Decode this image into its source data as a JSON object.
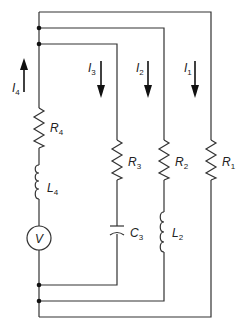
{
  "diagram": {
    "type": "circuit",
    "components": {
      "R1": {
        "label": "R",
        "sub": "1"
      },
      "R2": {
        "label": "R",
        "sub": "2"
      },
      "R3": {
        "label": "R",
        "sub": "3"
      },
      "R4": {
        "label": "R",
        "sub": "4"
      },
      "L2": {
        "label": "L",
        "sub": "2"
      },
      "L4": {
        "label": "L",
        "sub": "4"
      },
      "C3": {
        "label": "C",
        "sub": "3"
      },
      "V": {
        "label": "V"
      }
    },
    "currents": {
      "I1": {
        "label": "I",
        "sub": "1",
        "direction": "down"
      },
      "I2": {
        "label": "I",
        "sub": "2",
        "direction": "down"
      },
      "I3": {
        "label": "I",
        "sub": "3",
        "direction": "down"
      },
      "I4": {
        "label": "I",
        "sub": "4",
        "direction": "up"
      }
    }
  }
}
